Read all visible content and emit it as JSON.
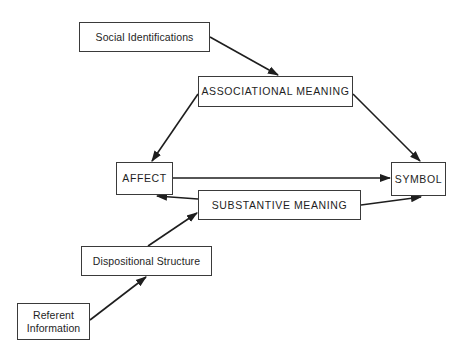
{
  "diagram": {
    "type": "flow-diagram",
    "nodes": {
      "social_identifications": {
        "label": "Social Identifications"
      },
      "associational_meaning": {
        "label": "ASSOCIATIONAL MEANING"
      },
      "affect": {
        "label": "AFFECT"
      },
      "symbol": {
        "label": "SYMBOL"
      },
      "substantive_meaning": {
        "label": "SUBSTANTIVE MEANING"
      },
      "dispositional_structure": {
        "label": "Dispositional Structure"
      },
      "referent_information": {
        "label": "Referent\nInformation"
      }
    },
    "edges": [
      {
        "from": "Social Identifications",
        "to": "ASSOCIATIONAL MEANING"
      },
      {
        "from": "ASSOCIATIONAL MEANING",
        "to": "AFFECT"
      },
      {
        "from": "ASSOCIATIONAL MEANING",
        "to": "SYMBOL"
      },
      {
        "from": "AFFECT",
        "to": "SYMBOL"
      },
      {
        "from": "SUBSTANTIVE MEANING",
        "to": "AFFECT"
      },
      {
        "from": "SUBSTANTIVE MEANING",
        "to": "SYMBOL"
      },
      {
        "from": "Dispositional Structure",
        "to": "SUBSTANTIVE MEANING"
      },
      {
        "from": "Referent Information",
        "to": "Dispositional Structure"
      }
    ],
    "colors": {
      "line": "#1e1e1e",
      "box_border": "#3a3a3a",
      "background": "#ffffff"
    }
  }
}
